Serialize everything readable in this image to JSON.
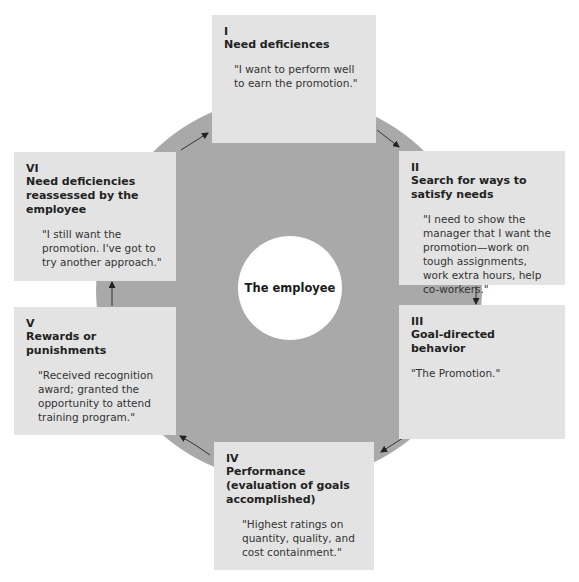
{
  "diagram": {
    "center_label": "The employee",
    "colors": {
      "ring": "#a9a9a9",
      "box": "#e3e3e3",
      "hub": "#ffffff"
    },
    "stages": [
      {
        "num": "I",
        "title": "Need deficiences",
        "quote": "\"I want to perform well to earn the promotion.\""
      },
      {
        "num": "II",
        "title": "Search for ways to satisfy needs",
        "quote": "\"I need to show the manager that I want the promotion—work on tough assignments, work extra hours, help co-workers.\""
      },
      {
        "num": "III",
        "title": "Goal-directed behavior",
        "quote": "\"The Promotion.\""
      },
      {
        "num": "IV",
        "title": "Performance (evaluation of goals accomplished)",
        "quote": "\"Highest ratings on quantity, quality, and cost containment.\""
      },
      {
        "num": "V",
        "title": "Rewards or punishments",
        "quote": "\"Received recognition award; granted the opportunity to attend training program.\""
      },
      {
        "num": "VI",
        "title": "Need deficiencies reassessed by the employee",
        "quote": "\"I still want the promotion. I've got to try another approach.\""
      }
    ]
  }
}
